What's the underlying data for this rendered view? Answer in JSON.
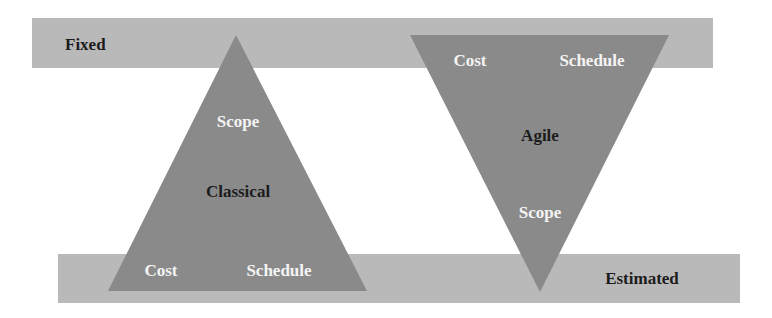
{
  "diagram": {
    "title": "",
    "colors": {
      "band": "#b9b9b9",
      "triangle": "#8a8a8a",
      "dark_text": "#1c1c1c",
      "light_text": "#f4f4f4",
      "background": "#ffffff"
    },
    "bands": {
      "top": {
        "label": "Fixed"
      },
      "bottom": {
        "label": "Estimated"
      }
    },
    "classical": {
      "name": "Classical",
      "orientation": "apex-up",
      "fixed": [
        "Scope"
      ],
      "estimated": [
        "Cost",
        "Schedule"
      ],
      "labels": {
        "apex": "Scope",
        "center": "Classical",
        "base_left": "Cost",
        "base_right": "Schedule"
      }
    },
    "agile": {
      "name": "Agile",
      "orientation": "apex-down",
      "fixed": [
        "Cost",
        "Schedule"
      ],
      "estimated": [
        "Scope"
      ],
      "labels": {
        "top_left": "Cost",
        "top_right": "Schedule",
        "center": "Agile",
        "apex": "Scope"
      }
    }
  }
}
